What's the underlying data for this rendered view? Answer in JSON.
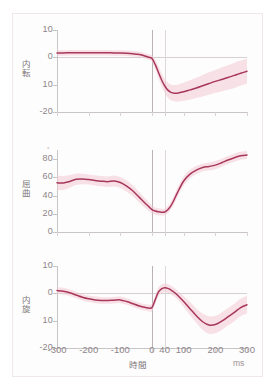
{
  "chart_data": {
    "type": "line",
    "title": "",
    "subtitle": "",
    "xlabel": "時間",
    "xunit": "ms",
    "xlim": [
      -300,
      300
    ],
    "xticks": [
      -300,
      -200,
      -100,
      0,
      40,
      100,
      200,
      300
    ],
    "xticklabels": [
      "-300",
      "-200",
      "-100",
      "0",
      "40",
      "100",
      "200",
      "300"
    ],
    "grid": false,
    "legend": "none",
    "reference_lines": [
      {
        "x": 0,
        "style": "solid-dark"
      },
      {
        "x": 40,
        "style": "solid-light"
      }
    ],
    "panels": [
      {
        "name": "adduction",
        "ylabel": "内転",
        "yunit": "°",
        "ylim": [
          -20,
          10
        ],
        "yticks": [
          10,
          0,
          -10,
          -20
        ],
        "yticklabels": [
          "10",
          "0",
          "10",
          "-20"
        ],
        "zero_line": 0,
        "series": [
          {
            "name": "mean",
            "x": [
              -300,
              -280,
              -260,
              -240,
              -220,
              -200,
              -180,
              -160,
              -140,
              -120,
              -100,
              -80,
              -60,
              -40,
              -20,
              -10,
              0,
              10,
              20,
              30,
              40,
              50,
              60,
              70,
              80,
              100,
              120,
              140,
              160,
              180,
              200,
              220,
              240,
              260,
              280,
              300
            ],
            "values": [
              1.6,
              1.6,
              1.7,
              1.7,
              1.7,
              1.7,
              1.7,
              1.7,
              1.7,
              1.6,
              1.6,
              1.5,
              1.3,
              1.0,
              0.4,
              0.0,
              -0.4,
              -2.6,
              -5.4,
              -8.2,
              -10.4,
              -12.0,
              -12.8,
              -13.1,
              -13.1,
              -12.6,
              -11.9,
              -11.2,
              -10.4,
              -9.6,
              -8.8,
              -8.1,
              -7.4,
              -6.6,
              -5.8,
              -5.1
            ]
          },
          {
            "name": "band_upper",
            "values": [
              2.6,
              2.6,
              2.7,
              2.7,
              2.7,
              2.7,
              2.7,
              2.7,
              2.7,
              2.6,
              2.6,
              2.5,
              2.3,
              2.0,
              1.4,
              1.0,
              0.8,
              -0.8,
              -3.2,
              -5.8,
              -7.8,
              -9.2,
              -9.9,
              -10.1,
              -10.0,
              -9.3,
              -8.4,
              -7.5,
              -6.5,
              -5.5,
              -4.6,
              -3.7,
              -2.9,
              -2.0,
              -1.2,
              -0.5
            ]
          },
          {
            "name": "band_lower",
            "values": [
              0.6,
              0.6,
              0.7,
              0.7,
              0.7,
              0.7,
              0.7,
              0.7,
              0.7,
              0.6,
              0.6,
              0.5,
              0.3,
              0.0,
              -0.6,
              -1.0,
              -1.6,
              -4.4,
              -7.6,
              -10.6,
              -13.0,
              -14.8,
              -15.7,
              -16.1,
              -16.2,
              -15.9,
              -15.4,
              -14.9,
              -14.3,
              -13.7,
              -13.0,
              -12.5,
              -11.9,
              -11.2,
              -10.4,
              -9.7
            ]
          }
        ]
      },
      {
        "name": "flexion",
        "ylabel": "屈曲",
        "yunit": "°",
        "ylim": [
          0,
          90
        ],
        "yticks": [
          80,
          60,
          40,
          20,
          0
        ],
        "yticklabels": [
          "80",
          "60",
          "40",
          "20",
          "0"
        ],
        "zero_line": null,
        "series": [
          {
            "name": "mean",
            "x": [
              -300,
              -280,
              -260,
              -240,
              -220,
              -200,
              -180,
              -160,
              -140,
              -120,
              -100,
              -80,
              -60,
              -40,
              -20,
              -10,
              0,
              10,
              20,
              30,
              40,
              50,
              60,
              70,
              80,
              100,
              120,
              140,
              160,
              180,
              200,
              220,
              240,
              260,
              280,
              300
            ],
            "values": [
              54.0,
              53.8,
              55.5,
              57.8,
              58.2,
              57.6,
              56.6,
              55.8,
              55.2,
              56.0,
              54.4,
              50.4,
              45.0,
              38.0,
              31.0,
              27.8,
              24.6,
              23.0,
              22.2,
              21.8,
              22.0,
              24.5,
              29.0,
              35.5,
              43.0,
              56.0,
              63.5,
              68.0,
              70.8,
              72.0,
              73.4,
              76.0,
              79.0,
              81.5,
              83.6,
              84.4
            ]
          },
          {
            "name": "band_upper",
            "values": [
              62.0,
              61.5,
              62.5,
              64.0,
              64.0,
              63.2,
              62.2,
              61.4,
              61.0,
              62.0,
              60.5,
              56.6,
              51.0,
              43.8,
              36.2,
              32.6,
              29.0,
              27.0,
              26.0,
              25.4,
              25.6,
              28.4,
              33.4,
              40.4,
              48.0,
              61.0,
              68.2,
              72.4,
              75.0,
              76.2,
              77.8,
              80.4,
              83.4,
              86.0,
              88.0,
              88.8
            ]
          },
          {
            "name": "band_lower",
            "values": [
              46.0,
              46.1,
              48.5,
              51.6,
              52.4,
              52.0,
              51.0,
              50.2,
              49.4,
              50.0,
              48.3,
              44.2,
              39.0,
              32.2,
              25.8,
              23.0,
              20.2,
              19.0,
              18.4,
              18.2,
              18.4,
              20.6,
              24.6,
              30.6,
              38.0,
              51.0,
              58.8,
              63.6,
              66.6,
              67.8,
              69.0,
              71.6,
              74.6,
              77.0,
              79.2,
              80.0
            ]
          }
        ]
      },
      {
        "name": "internal-rotation",
        "ylabel": "内旋",
        "yunit": "°",
        "ylim": [
          -20,
          10
        ],
        "yticks": [
          10,
          0,
          -10,
          -20
        ],
        "yticklabels": [
          "10",
          "0",
          "10",
          "-20"
        ],
        "zero_line": 0,
        "series": [
          {
            "name": "mean",
            "x": [
              -300,
              -280,
              -260,
              -240,
              -220,
              -200,
              -180,
              -160,
              -140,
              -120,
              -100,
              -80,
              -60,
              -40,
              -20,
              -10,
              0,
              10,
              20,
              30,
              40,
              50,
              60,
              70,
              80,
              100,
              120,
              140,
              160,
              180,
              200,
              220,
              240,
              260,
              280,
              300
            ],
            "values": [
              1.0,
              0.8,
              0.2,
              -0.6,
              -1.4,
              -2.0,
              -2.4,
              -2.6,
              -2.6,
              -2.5,
              -2.4,
              -3.0,
              -3.8,
              -4.6,
              -5.2,
              -5.4,
              -5.2,
              -2.4,
              0.4,
              1.6,
              2.0,
              1.8,
              1.2,
              0.4,
              -0.6,
              -3.0,
              -5.6,
              -8.2,
              -10.4,
              -11.6,
              -11.4,
              -10.2,
              -8.6,
              -7.0,
              -5.2,
              -4.2
            ]
          },
          {
            "name": "band_upper",
            "values": [
              2.2,
              2.0,
              1.4,
              0.6,
              -0.2,
              -0.8,
              -1.2,
              -1.4,
              -1.4,
              -1.3,
              -1.2,
              -1.8,
              -2.6,
              -3.4,
              -4.0,
              -4.2,
              -3.8,
              -0.8,
              2.0,
              3.2,
              3.6,
              3.4,
              2.8,
              2.0,
              1.0,
              -1.0,
              -3.2,
              -5.6,
              -7.4,
              -8.4,
              -8.2,
              -7.0,
              -5.4,
              -3.8,
              -2.0,
              -1.0
            ]
          },
          {
            "name": "band_lower",
            "values": [
              -0.2,
              -0.4,
              -1.0,
              -1.8,
              -2.6,
              -3.2,
              -3.6,
              -3.8,
              -3.8,
              -3.7,
              -3.6,
              -4.2,
              -5.0,
              -5.8,
              -6.4,
              -6.6,
              -6.6,
              -4.0,
              -1.2,
              0.0,
              0.4,
              0.2,
              -0.4,
              -1.2,
              -2.2,
              -5.0,
              -8.0,
              -10.8,
              -13.4,
              -14.8,
              -14.6,
              -13.4,
              -11.8,
              -10.2,
              -8.4,
              -7.4
            ]
          }
        ]
      }
    ],
    "colors": {
      "line": "#a8375a",
      "band": "#f3c9d6",
      "axis": "#c9c4c6",
      "text": "#8d8589",
      "reference_primary": "#b9b3b6",
      "reference_secondary": "#ded8db",
      "frame": "#f0e7ea"
    }
  }
}
